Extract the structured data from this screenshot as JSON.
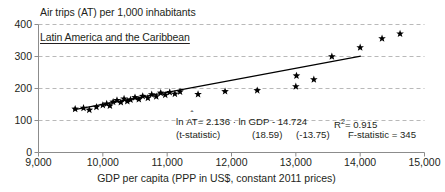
{
  "chart_data": {
    "type": "scatter",
    "title": "Air trips (AT) per 1,000 inhabitants",
    "annotation": "Latin America and the Caribbean",
    "xlabel": "GDP per capita (PPP in US$, constant 2011 prices)",
    "ylabel": "",
    "xlim": [
      9000,
      15000
    ],
    "ylim": [
      0,
      400
    ],
    "xticks": [
      "9,000",
      "10,000",
      "11,000",
      "12,000",
      "13,000",
      "14,000",
      "15,000"
    ],
    "xtick_values": [
      9000,
      10000,
      11000,
      12000,
      13000,
      14000,
      15000
    ],
    "yticks": [
      "0",
      "100",
      "200",
      "300",
      "400"
    ],
    "ytick_values": [
      0,
      100,
      200,
      300,
      400
    ],
    "grid": "horizontal-dashed",
    "legend": "none",
    "marker": "star",
    "marker_color": "#000000",
    "line_color": "#000000",
    "grid_color": "#b9b9b9",
    "axis_color": "#8c8c8c",
    "points": [
      [
        9570,
        136
      ],
      [
        9700,
        139
      ],
      [
        9790,
        133
      ],
      [
        9900,
        142
      ],
      [
        10000,
        148
      ],
      [
        10060,
        152
      ],
      [
        10110,
        146
      ],
      [
        10160,
        158
      ],
      [
        10220,
        163
      ],
      [
        10280,
        157
      ],
      [
        10330,
        168
      ],
      [
        10380,
        160
      ],
      [
        10430,
        165
      ],
      [
        10500,
        172
      ],
      [
        10560,
        166
      ],
      [
        10620,
        176
      ],
      [
        10700,
        170
      ],
      [
        10760,
        181
      ],
      [
        10830,
        175
      ],
      [
        10900,
        186
      ],
      [
        10970,
        180
      ],
      [
        11040,
        188
      ],
      [
        11120,
        183
      ],
      [
        11200,
        190
      ],
      [
        11480,
        182
      ],
      [
        11900,
        191
      ],
      [
        12400,
        194
      ],
      [
        13000,
        206
      ],
      [
        13010,
        240
      ],
      [
        13280,
        228
      ],
      [
        13560,
        300
      ],
      [
        14000,
        328
      ],
      [
        14340,
        356
      ],
      [
        14620,
        371
      ]
    ],
    "fit_line": {
      "x_start": 9540,
      "y_start": 133,
      "x_end": 14010,
      "y_end": 301
    }
  },
  "stats": {
    "equation": {
      "lhs_prefix": "ln ",
      "lhs_var": "AT",
      "lhs_hat": "ˆ",
      "equals": "= 2.136 · ln GDP - 14.724",
      "r_squared_label": "R",
      "r_squared_sup": "2",
      "r_squared_value": "= 0.915"
    },
    "tstat_row": {
      "label": "(t-statistic)",
      "slope_t": "(18.59)",
      "intercept_t": "(-13.75)",
      "f_statistic": "F-statistic = 345"
    }
  }
}
